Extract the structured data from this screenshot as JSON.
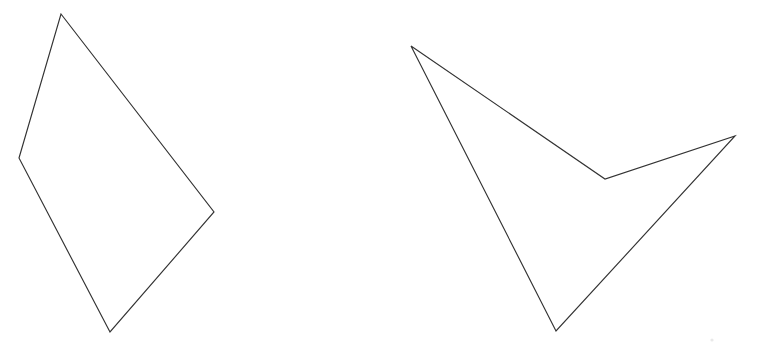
{
  "figure": {
    "background_color": "#ffffff",
    "stroke_color": "#333333",
    "stroke_width": 1.15,
    "width": 757,
    "height": 356
  },
  "chart_data": {
    "type": "scatter",
    "subtitle": "",
    "xlabel": "",
    "ylabel": "",
    "xlim": [
      0,
      757
    ],
    "ylim": [
      0,
      356
    ],
    "grid": false,
    "legend": "none",
    "axes_visible": false,
    "tick_labels_x": [],
    "tick_labels_y": [],
    "annotations": [],
    "shapes": [
      {
        "name": "left-quadrilateral",
        "kind": "polygon",
        "convexity": "convex",
        "vertex_count": 4,
        "closed": true,
        "fill": "none",
        "stroke": "#333333",
        "points": [
          [
            61,
            14
          ],
          [
            214,
            212
          ],
          [
            110,
            332
          ],
          [
            19,
            158
          ]
        ],
        "points_path": "61,14 214,212 110,332 19,158"
      },
      {
        "name": "right-quadrilateral",
        "kind": "polygon",
        "convexity": "concave",
        "vertex_count": 4,
        "closed": true,
        "fill": "none",
        "stroke": "#333333",
        "reflex_vertex": [
          605,
          179
        ],
        "points": [
          [
            411,
            46
          ],
          [
            605,
            179
          ],
          [
            735,
            136
          ],
          [
            556,
            331
          ]
        ],
        "points_path": "411,46 605,179 735,136 556,331"
      }
    ],
    "artifacts": [
      {
        "name": "faint-speck",
        "x": 712,
        "y": 340,
        "radius": 1.6,
        "color": "#e9e9e9"
      }
    ]
  }
}
